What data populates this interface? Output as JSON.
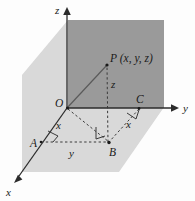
{
  "figure": {
    "colors": {
      "plane_vertical_dark": "#9a9a9a",
      "plane_horizontal_light": "#d9d9d9",
      "line": "#2b2b2b",
      "text": "#1a1a1a",
      "background": "#fdfdfd"
    },
    "axes": [
      {
        "name": "z-axis",
        "label": "z",
        "direction": "up"
      },
      {
        "name": "y-axis",
        "label": "y",
        "direction": "right"
      },
      {
        "name": "x-axis",
        "label": "x",
        "direction": "down-left"
      }
    ],
    "labels": {
      "z_axis": "z",
      "y_axis": "y",
      "x_axis": "x",
      "origin": "O",
      "point_p": "P (x, y, z)",
      "point_a": "A",
      "point_b": "B",
      "point_c": "C",
      "seg_z": "z",
      "seg_x_left": "x",
      "seg_x_right": "x",
      "seg_y": "y"
    },
    "points": [
      {
        "name": "O",
        "label": "O",
        "role": "origin"
      },
      {
        "name": "P",
        "label": "P (x, y, z)",
        "role": "point-in-space"
      },
      {
        "name": "A",
        "label": "A",
        "role": "x-axis-foot"
      },
      {
        "name": "B",
        "label": "B",
        "role": "xy-plane-projection"
      },
      {
        "name": "C",
        "label": "C",
        "role": "y-axis-foot"
      }
    ],
    "segments": [
      {
        "name": "OA",
        "label": "x",
        "style": "solid"
      },
      {
        "name": "AB",
        "label": "y",
        "style": "dashed"
      },
      {
        "name": "CB",
        "label": "x",
        "style": "dashed"
      },
      {
        "name": "BP",
        "label": "z",
        "style": "dashed"
      },
      {
        "name": "OP",
        "label": "",
        "style": "solid"
      },
      {
        "name": "OB",
        "label": "",
        "style": "dashed"
      }
    ],
    "right_angles": [
      {
        "name": "right-angle-at-A"
      },
      {
        "name": "right-angle-at-B"
      },
      {
        "name": "right-angle-at-C"
      }
    ]
  }
}
